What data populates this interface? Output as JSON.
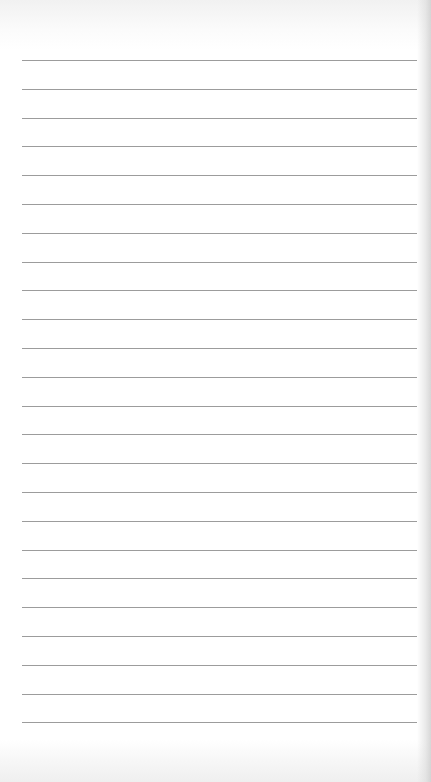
{
  "page": {
    "type": "lined-paper",
    "line_count": 24,
    "first_line_y": 60,
    "line_spacing": 28.8,
    "line_left": 22,
    "line_width": 395,
    "colors": {
      "paper": "#ffffff",
      "line": "#9c9c9c",
      "edge_shadow": "#cdcdcd"
    }
  }
}
